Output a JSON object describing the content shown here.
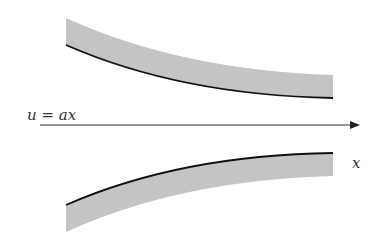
{
  "diagram": {
    "flow_label": "u = ax",
    "axis_label": "x",
    "colors": {
      "band_fill": "#c4c4c4",
      "wall_line": "#111111",
      "arrow": "#333333",
      "background": "#ffffff"
    },
    "elements": {
      "top_wall": "upper converging wall with shaded boundary layer",
      "bottom_wall": "lower converging wall with shaded boundary layer",
      "flow_arrow": "centerline flow direction arrow"
    }
  }
}
